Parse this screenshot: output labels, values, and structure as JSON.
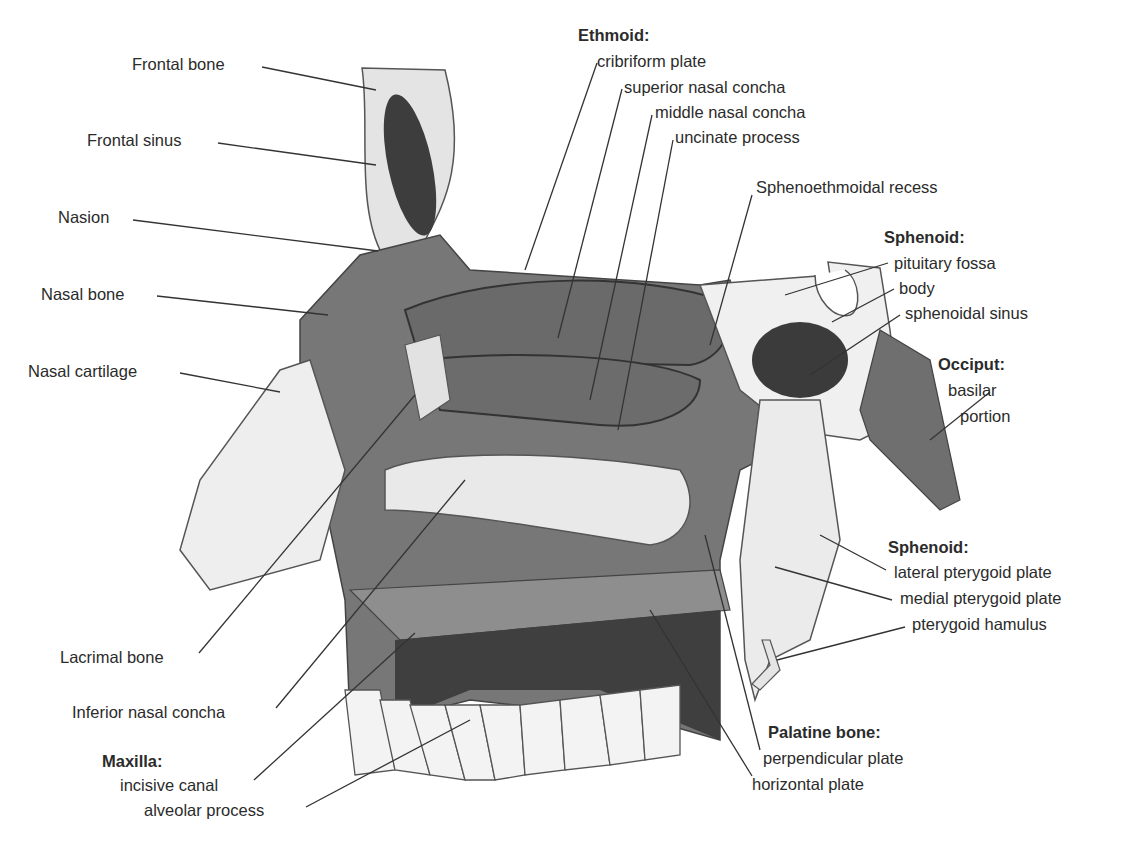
{
  "diagram": {
    "colors": {
      "bone_dark": "#6e6e6e",
      "bone_mid": "#8a8a8a",
      "bone_light": "#e6e6e6",
      "sinus": "#3a3a3a",
      "line": "#3a3a3a",
      "text": "#2b2b2b"
    },
    "left_labels": {
      "frontal_bone": "Frontal bone",
      "frontal_sinus": "Frontal sinus",
      "nasion": "Nasion",
      "nasal_bone": "Nasal bone",
      "nasal_cartilage": "Nasal cartilage",
      "lacrimal_bone": "Lacrimal bone",
      "inferior_nasal_concha": "Inferior nasal concha"
    },
    "ethmoid": {
      "heading": "Ethmoid:",
      "items": [
        "cribriform plate",
        "superior nasal concha",
        "middle nasal concha",
        "uncinate process"
      ]
    },
    "sphenoethmoidal_recess": "Sphenoethmoidal recess",
    "sphenoid_top": {
      "heading": "Sphenoid:",
      "items": [
        "pituitary fossa",
        "body",
        "sphenoidal sinus"
      ]
    },
    "occiput": {
      "heading": "Occiput:",
      "items": [
        "basilar",
        "portion"
      ]
    },
    "sphenoid_bottom": {
      "heading": "Sphenoid:",
      "items": [
        "lateral pterygoid plate",
        "medial pterygoid plate",
        "pterygoid hamulus"
      ]
    },
    "maxilla": {
      "heading": "Maxilla:",
      "items": [
        "incisive canal",
        "alveolar process"
      ]
    },
    "palatine": {
      "heading": "Palatine bone:",
      "items": [
        "perpendicular plate",
        "horizontal plate"
      ]
    }
  }
}
